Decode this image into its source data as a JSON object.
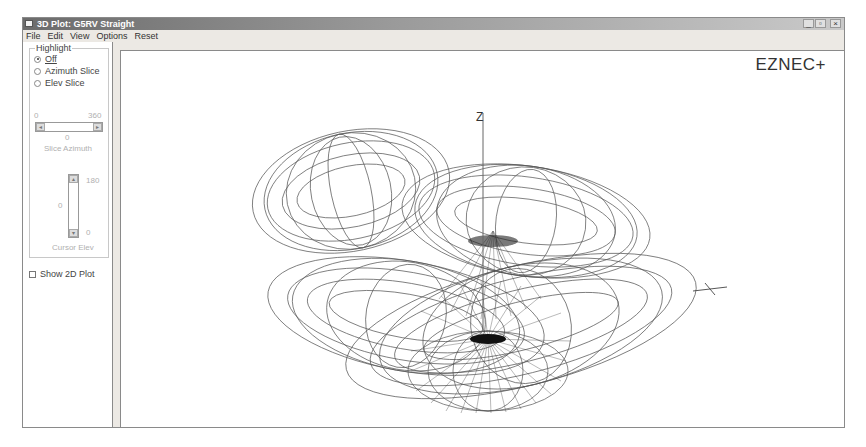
{
  "window": {
    "title": "3D Plot: G5RV Straight",
    "controls": {
      "minimize": "_",
      "maximize": "▫",
      "close": "×"
    }
  },
  "menu": {
    "items": [
      "File",
      "Edit",
      "View",
      "Options",
      "Reset"
    ]
  },
  "left_panel": {
    "highlight_group": {
      "label": "Highlight",
      "options": [
        {
          "label": "Off",
          "checked": true
        },
        {
          "label": "Azimuth Slice",
          "checked": false
        },
        {
          "label": "Elev Slice",
          "checked": false
        }
      ]
    },
    "azimuth_slider": {
      "min": "0",
      "max": "360",
      "value": "0",
      "caption": "Slice Azimuth"
    },
    "elev_slider": {
      "max": "180",
      "min": "0",
      "value": "0",
      "caption": "Cursor Elev"
    },
    "show_2d_plot": {
      "label": "Show 2D Plot",
      "checked": false
    }
  },
  "plot": {
    "brand": "EZNEC+",
    "axis_labels": {
      "z": "Z",
      "x": "X"
    },
    "line_color": "#3a3a3a"
  }
}
